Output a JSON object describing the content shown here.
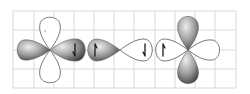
{
  "diagram": {
    "title": "",
    "grid": {
      "left": 13,
      "right": 236,
      "top": 11,
      "bottom": 88,
      "columns": 11,
      "rows": 4,
      "color": "#d9d9d9"
    },
    "atoms": [
      {
        "name": "left-atom",
        "center": [
          50,
          50
        ],
        "lobes": [
          {
            "direction": "up",
            "style": "outline"
          },
          {
            "direction": "down",
            "style": "outline"
          },
          {
            "direction": "left",
            "style": "filled"
          },
          {
            "direction": "right",
            "style": "filled",
            "electron": "down"
          }
        ]
      },
      {
        "name": "middle-bond",
        "center": [
          120,
          50
        ],
        "lobes": [
          {
            "direction": "left",
            "style": "filled",
            "electron": "up"
          },
          {
            "direction": "right",
            "style": "outline",
            "electron": "down"
          }
        ]
      },
      {
        "name": "right-atom",
        "center": [
          188,
          50
        ],
        "lobes": [
          {
            "direction": "left",
            "style": "outline",
            "electron": "up"
          },
          {
            "direction": "right",
            "style": "outline"
          },
          {
            "direction": "up",
            "style": "filled"
          },
          {
            "direction": "down",
            "style": "filled"
          }
        ]
      }
    ],
    "colors": {
      "lobe_light": "#d8d8d8",
      "lobe_dark": "#4a4a4a",
      "outline": "#7a7a7a",
      "electron": "#1a1a1a"
    }
  }
}
